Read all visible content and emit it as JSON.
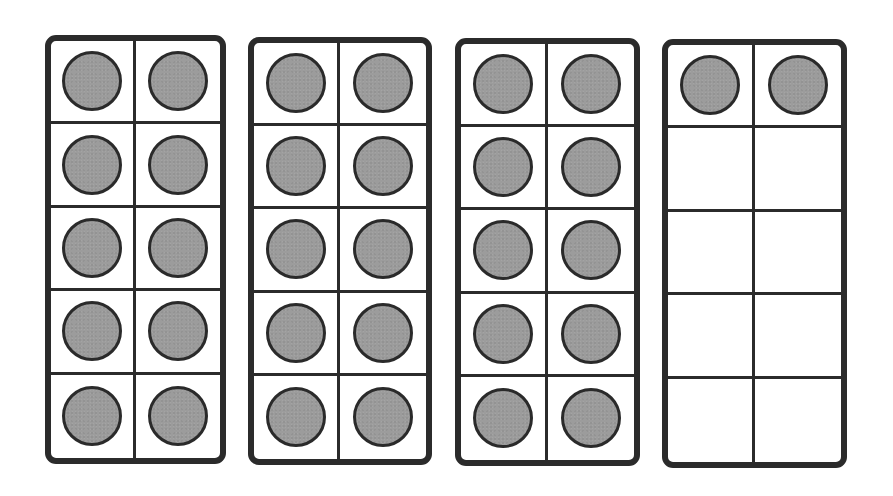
{
  "diagram": {
    "type": "ten-frames",
    "colors": {
      "frame_border": "#2b2b2b",
      "counter_fill": "#9c9c9c",
      "counter_border": "#2a2a2a",
      "background": "#ffffff"
    },
    "frames": [
      {
        "id": "frame-1",
        "box": {
          "left": 45,
          "top": 35,
          "width": 181,
          "height": 429
        },
        "filled_count": 10,
        "cells": [
          true,
          true,
          true,
          true,
          true,
          true,
          true,
          true,
          true,
          true
        ]
      },
      {
        "id": "frame-2",
        "box": {
          "left": 248,
          "top": 37,
          "width": 184,
          "height": 428
        },
        "filled_count": 10,
        "cells": [
          true,
          true,
          true,
          true,
          true,
          true,
          true,
          true,
          true,
          true
        ]
      },
      {
        "id": "frame-3",
        "box": {
          "left": 455,
          "top": 38,
          "width": 185,
          "height": 428
        },
        "filled_count": 10,
        "cells": [
          true,
          true,
          true,
          true,
          true,
          true,
          true,
          true,
          true,
          true
        ]
      },
      {
        "id": "frame-4",
        "box": {
          "left": 662,
          "top": 39,
          "width": 185,
          "height": 429
        },
        "filled_count": 2,
        "cells": [
          true,
          true,
          false,
          false,
          false,
          false,
          false,
          false,
          false,
          false
        ]
      }
    ],
    "total_counters": 32
  }
}
